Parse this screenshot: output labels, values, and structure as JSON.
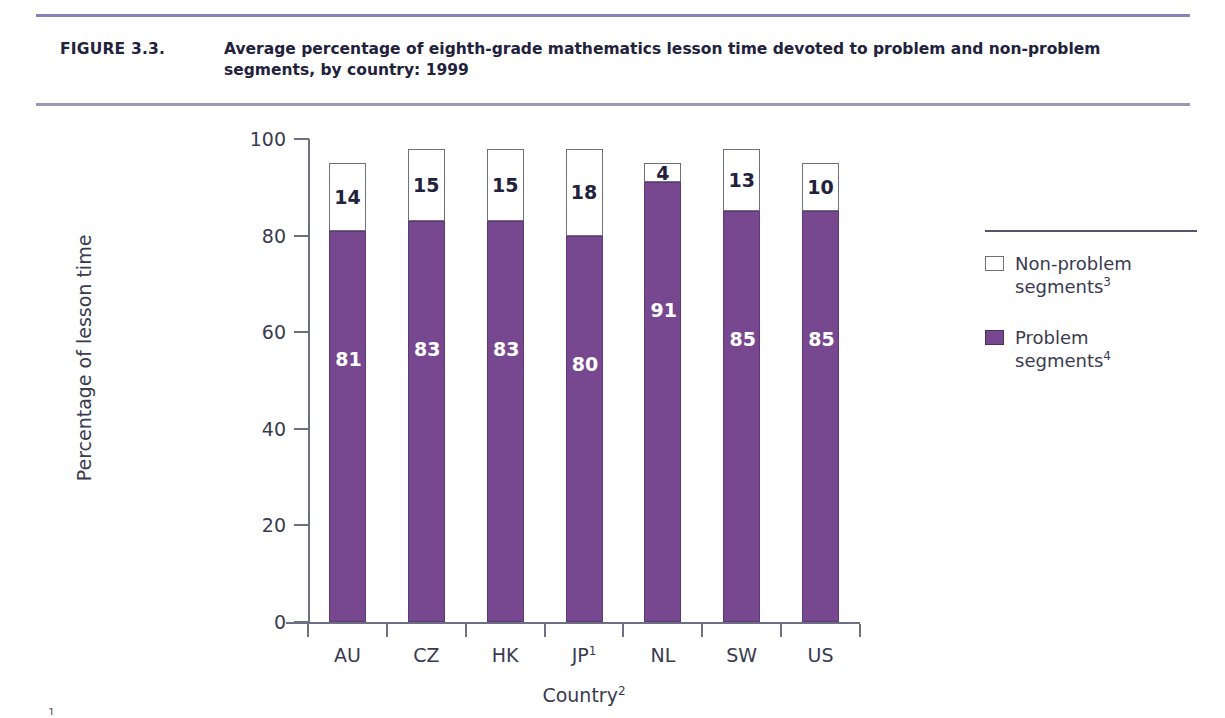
{
  "header": {
    "figure_label": "FIGURE 3.3.",
    "title": "Average percentage of eighth-grade mathematics lesson time devoted to problem and non-problem segments, by country: 1999",
    "rule_color": "#8f7fb8"
  },
  "legend": {
    "items": [
      {
        "swatch": "white",
        "line1": "Non-problem",
        "line2": "segments",
        "sup": "3"
      },
      {
        "swatch": "purple",
        "line1": "Problem",
        "line2": "segments",
        "sup": "4"
      }
    ]
  },
  "footnote_stub": "1",
  "chart_data": {
    "type": "bar",
    "subtype": "stacked",
    "title": "Average percentage of eighth-grade mathematics lesson time devoted to problem and non-problem segments, by country: 1999",
    "xlabel": "Country",
    "xlabel_sup": "2",
    "ylabel": "Percentage of lesson time",
    "ylim": [
      0,
      100
    ],
    "yticks": [
      0,
      20,
      40,
      60,
      80,
      100
    ],
    "grid": false,
    "legend_position": "right",
    "categories": [
      "AU",
      "CZ",
      "HK",
      "JP",
      "NL",
      "SW",
      "US"
    ],
    "category_sups": [
      "",
      "",
      "",
      "1",
      "",
      "",
      ""
    ],
    "series": [
      {
        "name": "Problem segments",
        "sup": "4",
        "color": "#77488f",
        "values": [
          81,
          83,
          83,
          80,
          91,
          85,
          85
        ]
      },
      {
        "name": "Non-problem segments",
        "sup": "3",
        "color": "#ffffff",
        "values": [
          14,
          15,
          15,
          18,
          4,
          13,
          10
        ]
      }
    ]
  }
}
